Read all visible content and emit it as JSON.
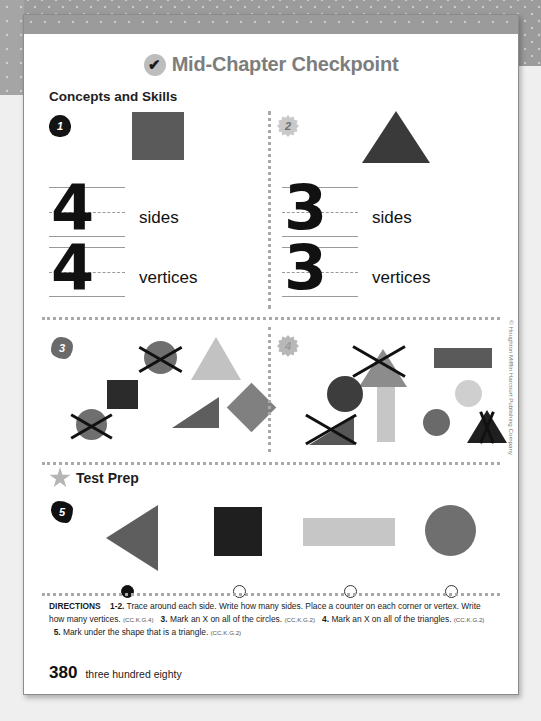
{
  "document": {
    "title": "Mid-Chapter Checkpoint",
    "title_icon": "check-circle-icon",
    "section_heading": "Concepts and Skills",
    "page_number": "380",
    "page_number_words": "three hundred eighty",
    "copyright": "© Houghton Mifflin Harcourt Publishing Company"
  },
  "problems": [
    {
      "number": "1",
      "badge_icon": "apple-badge-icon",
      "figure": "filled-square",
      "figure_color": "#5a5a5a",
      "answers": [
        {
          "value": "4",
          "label": "sides"
        },
        {
          "value": "4",
          "label": "vertices"
        }
      ]
    },
    {
      "number": "2",
      "badge_icon": "starburst-badge-icon",
      "figure": "filled-triangle",
      "figure_color": "#3a3a3a",
      "answers": [
        {
          "value": "3",
          "label": "sides"
        },
        {
          "value": "3",
          "label": "vertices"
        }
      ]
    },
    {
      "number": "3",
      "badge_icon": "blob-badge-icon",
      "task": "Mark an X on all of the circles.",
      "shapes": [
        {
          "name": "circle",
          "color": "#6f6f6f",
          "marked": true
        },
        {
          "name": "triangle",
          "color": "#c2c2c2",
          "marked": false
        },
        {
          "name": "square",
          "color": "#2b2b2b",
          "marked": false
        },
        {
          "name": "right-triangle",
          "color": "#5e5e5e",
          "marked": false
        },
        {
          "name": "diamond",
          "color": "#808080",
          "marked": false
        },
        {
          "name": "circle",
          "color": "#6f6f6f",
          "marked": true
        }
      ]
    },
    {
      "number": "4",
      "badge_icon": "gear-badge-icon",
      "task": "Mark an X on all of the triangles.",
      "shapes": [
        {
          "name": "triangle",
          "color": "#8c8c8c",
          "marked": true
        },
        {
          "name": "rectangle",
          "color": "#5a5a5a",
          "marked": false
        },
        {
          "name": "circle",
          "color": "#3d3d3d",
          "marked": false
        },
        {
          "name": "circle",
          "color": "#cfcfcf",
          "marked": false
        },
        {
          "name": "vertical-rectangle",
          "color": "#c6c6c6",
          "marked": false
        },
        {
          "name": "triangle",
          "color": "#565656",
          "marked": true
        },
        {
          "name": "circle",
          "color": "#6a6a6a",
          "marked": false
        },
        {
          "name": "triangle",
          "color": "#1f1f1f",
          "marked": true
        }
      ]
    }
  ],
  "test_prep": {
    "heading": "Test Prep",
    "heading_icon": "star-icon",
    "number": "5",
    "badge_icon": "blob-badge-icon",
    "options": [
      {
        "shape": "left-pointing-triangle",
        "color": "#5e5e5e",
        "selected": true
      },
      {
        "shape": "square",
        "color": "#1f1f1f",
        "selected": false
      },
      {
        "shape": "rectangle",
        "color": "#c6c6c6",
        "selected": false
      },
      {
        "shape": "circle",
        "color": "#6f6f6f",
        "selected": false
      }
    ]
  },
  "directions": {
    "label": "DIRECTIONS",
    "items": [
      {
        "num": "1-2.",
        "text": "Trace around each side. Write how many sides. Place a counter on each corner or vertex. Write how many vertices.",
        "standard": "(CC.K.G.4)"
      },
      {
        "num": "3.",
        "text": "Mark an X on all of the circles.",
        "standard": "(CC.K.G.2)"
      },
      {
        "num": "4.",
        "text": "Mark an X on all of the triangles.",
        "standard": "(CC.K.G.2)"
      },
      {
        "num": "5.",
        "text": "Mark under the shape that is a triangle.",
        "standard": "(CC.K.G.2)"
      }
    ]
  }
}
